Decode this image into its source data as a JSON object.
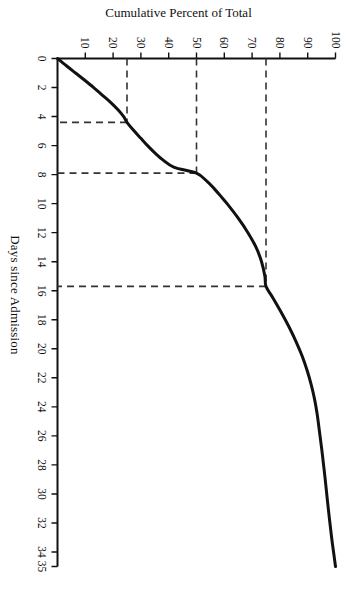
{
  "figure": {
    "background_color": "#ffffff",
    "line_color": "#111111",
    "dash_color": "#333333"
  },
  "chart_data": {
    "type": "line",
    "title": "",
    "subtitle": "",
    "xlabel": "Days since Admission",
    "ylabel": "Cumulative Percent of Total",
    "xlim": [
      0,
      35
    ],
    "ylim": [
      0,
      100
    ],
    "grid": false,
    "legend": null,
    "legend_position": "none",
    "x_ticks": [
      0,
      2,
      4,
      6,
      8,
      10,
      12,
      14,
      16,
      18,
      20,
      22,
      24,
      26,
      28,
      30,
      32,
      34,
      35
    ],
    "x_tick_labels": [
      "0",
      "2",
      "4",
      "6",
      "8",
      "10",
      "12",
      "14",
      "16",
      "18",
      "20",
      "22",
      "24",
      "26",
      "28",
      "30",
      "32",
      "34",
      "35"
    ],
    "y_ticks": [
      10,
      20,
      30,
      40,
      50,
      60,
      70,
      80,
      90,
      100
    ],
    "y_tick_labels": [
      "10",
      "20",
      "30",
      "40",
      "50",
      "60",
      "70",
      "80",
      "90",
      "100"
    ],
    "series": [
      {
        "name": "Cumulative Percent of Total",
        "style": "solid",
        "width": 3,
        "x": [
          0,
          0.5,
          1,
          1.5,
          2,
          2.5,
          3,
          3.5,
          4,
          4.4,
          5,
          5.5,
          6,
          6.5,
          7,
          7.5,
          7.9,
          8.5,
          9,
          9.5,
          10,
          11,
          12,
          13,
          14,
          15,
          15.7,
          16.5,
          17.5,
          18.5,
          19.5,
          20.5,
          21.5,
          22.5,
          23.5,
          24.5,
          25.5,
          27,
          29,
          31,
          33,
          34,
          35
        ],
        "y": [
          0,
          3.2,
          6.5,
          9.8,
          13,
          16,
          19,
          21.6,
          23.8,
          25,
          27.6,
          30,
          32.4,
          35,
          38,
          42,
          50,
          54,
          56.5,
          58.8,
          61,
          65,
          68.5,
          71.4,
          73.4,
          74.6,
          75,
          77.5,
          80.5,
          83.3,
          85.8,
          88,
          89.8,
          91.3,
          92.5,
          93.4,
          94.1,
          95.1,
          96.3,
          97.4,
          98.6,
          99.3,
          100
        ]
      }
    ],
    "annotations": [
      {
        "name": "first-quartile-reference",
        "style": "dashed",
        "percent": 25,
        "days": 4.4,
        "label": "25% at 4.4 days"
      },
      {
        "name": "median-reference",
        "style": "dashed",
        "percent": 50,
        "days": 7.9,
        "label": "50% at 7.9 days"
      },
      {
        "name": "third-quartile-reference",
        "style": "dashed",
        "percent": 75,
        "days": 15.7,
        "label": "75% at 15.7 days"
      }
    ]
  }
}
